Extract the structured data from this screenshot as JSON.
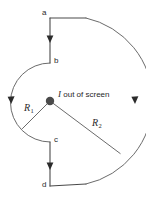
{
  "figure": {
    "type": "physics-diagram",
    "background_color": "#ffffff",
    "wire_color": "#4a4a4a",
    "arc_color": "#6b6b6b",
    "label_color": "#2b2b2b",
    "nodes": [
      {
        "id": "a",
        "label": "a",
        "x": 50,
        "y": 18
      },
      {
        "id": "b",
        "label": "b",
        "x": 50,
        "y": 63
      },
      {
        "id": "c",
        "label": "c",
        "x": 50,
        "y": 142
      },
      {
        "id": "d",
        "label": "d",
        "x": 50,
        "y": 186
      }
    ],
    "radii": [
      {
        "id": "R1",
        "symbol": "R",
        "subscript": "1",
        "value_px": 39
      },
      {
        "id": "R2",
        "symbol": "R",
        "subscript": "2",
        "value_px": 85
      }
    ],
    "center": {
      "x": 50,
      "y": 101,
      "radius_px": 4.2
    },
    "current": {
      "symbol": "I",
      "text": "out of screen",
      "full": "I out of screen"
    },
    "arrows": [
      {
        "on": "segment-a-b",
        "direction": "down"
      },
      {
        "on": "segment-c-d",
        "direction": "down"
      },
      {
        "on": "arc-R1",
        "direction": "counterclockwise"
      },
      {
        "on": "arc-R2",
        "direction": "clockwise"
      }
    ]
  }
}
